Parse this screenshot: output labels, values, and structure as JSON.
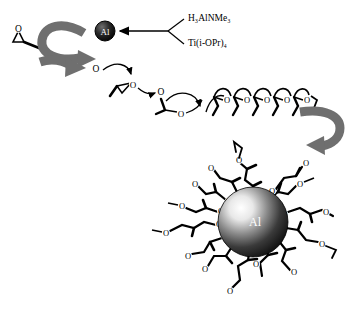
{
  "figure": {
    "name": "polymerization-scheme",
    "background_color": "#ffffff"
  },
  "reagents": {
    "label_1": "H₃AlNMe₃",
    "label_2": "Ti(i-OPr)₄",
    "bracket": "reagent-bracket"
  },
  "atoms": {
    "oxygen": "O",
    "aluminium": "Al"
  },
  "initiator": {
    "core_label": "Al",
    "core_color": "#1a1a1a",
    "text_color": "#ffffff"
  },
  "nanoparticle": {
    "core_label": "Al",
    "core_color_light": "#f2f2f2",
    "core_color_dark": "#111111",
    "text_color": "#ffffff",
    "arm_count": 16
  },
  "monomer": {
    "name": "epoxide",
    "oxygen_label": "O"
  },
  "chain": {
    "intermediate_oxygens": [
      "O",
      "O",
      "O",
      "O",
      "O"
    ],
    "coil_units": [
      "O",
      "O",
      "O",
      "O",
      "O"
    ]
  },
  "arrows": {
    "bulk_color": "#6f6f6f",
    "thin_color": "#000000",
    "top_curved": "bulk-curved-arrow-top",
    "right_curved": "bulk-curved-arrow-right",
    "reagent_arrow": "reagent-arrow"
  },
  "colors": {
    "bond": "#000000",
    "bulk_arrow": "#6f6f6f",
    "background": "#ffffff"
  }
}
